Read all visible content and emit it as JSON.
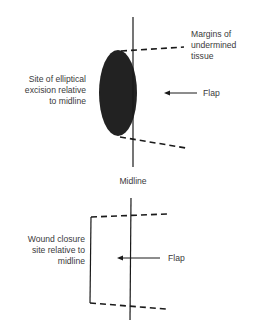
{
  "top_panel": {
    "excision_label": [
      "Site of elliptical",
      "excision relative",
      "to midline"
    ],
    "margins_label": [
      "Margins of",
      "undermined",
      "tissue"
    ],
    "flap_label": "Flap"
  },
  "midline_label": "Midline",
  "bottom_panel": {
    "closure_label": [
      "Wound closure",
      "site relative to",
      "midline"
    ],
    "flap_label": "Flap"
  },
  "colors": {
    "ink": "#1a1a1a",
    "ellipse_fill": "#222222",
    "text": "#3a3a3a",
    "background": "#ffffff"
  }
}
